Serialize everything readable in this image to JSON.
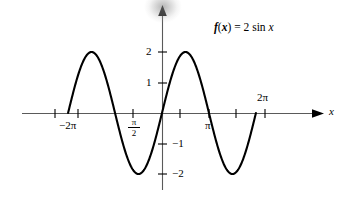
{
  "figure": {
    "function_label": {
      "f": "f",
      "paren_open": "(",
      "variable": "x",
      "paren_close": ")",
      "equals": " = ",
      "amplitude": "2",
      "trig": " sin ",
      "argument": "x"
    },
    "axis_label_x": "x",
    "curve_color": "#000000",
    "axis_color": "#555555"
  },
  "axes": {
    "x_ticks": [
      {
        "label": "−2π",
        "value": -6.2832,
        "px": 55
      },
      {
        "label": "",
        "value": -4.7124,
        "px": 78
      },
      {
        "label": "π/2",
        "value": -1.5708,
        "px": 133
      },
      {
        "label": "",
        "value": 1.5708,
        "px": 180
      },
      {
        "label": "π",
        "value": 3.1416,
        "px": 209
      },
      {
        "label": "",
        "value": 4.7124,
        "px": 236
      },
      {
        "label": "2π",
        "value": 6.2832,
        "px": 265
      }
    ],
    "x_tick_label_neg2pi": "−2π",
    "x_tick_label_pi": "π",
    "x_tick_label_2pi": "2π",
    "x_tick_fraction_numerator": "π",
    "x_tick_fraction_denominator": "2",
    "y_ticks": [
      {
        "label": "2",
        "value": 2,
        "px": 52
      },
      {
        "label": "1",
        "value": 1,
        "px": 83
      },
      {
        "label": "−1",
        "value": -1,
        "px": 144
      },
      {
        "label": "−2",
        "value": -2,
        "px": 174
      }
    ],
    "y_tick_label_2": "2",
    "y_tick_label_1": "1",
    "y_tick_label_neg1": "−1",
    "y_tick_label_neg2": "−2",
    "origin_px": {
      "x": 162,
      "y": 113
    },
    "x_unit_px": 14.95,
    "y_unit_px": 30.5,
    "x_axis_arrow": true,
    "y_axis_arrow": true,
    "grid": false
  },
  "chart_data": {
    "type": "line",
    "title": "",
    "subtitle": "",
    "xlabel": "x",
    "ylabel": "",
    "annotations": [
      {
        "text": "f(x) = 2 sin x",
        "x": 3.5,
        "y": 2.9
      }
    ],
    "legend": [],
    "legend_position": "none",
    "grid": false,
    "xlim": [
      -7.2,
      7.4
    ],
    "ylim": [
      -2.6,
      2.8
    ],
    "equation": "f(x) = 2 sin(x)",
    "amplitude": 2,
    "period": 6.2832,
    "series": [
      {
        "name": "f(x) = 2 sin x",
        "color": "#000000",
        "x": [
          -7.15,
          -6.9,
          -6.6,
          -6.283,
          -6.0,
          -5.7,
          -5.4,
          -5.1,
          -4.712,
          -4.4,
          -4.1,
          -3.8,
          -3.5,
          -3.142,
          -2.8,
          -2.5,
          -2.2,
          -1.9,
          -1.571,
          -1.25,
          -0.95,
          -0.65,
          -0.35,
          0.0,
          0.3,
          0.6,
          0.9,
          1.2,
          1.571,
          1.9,
          2.2,
          2.5,
          2.8,
          3.142,
          3.45,
          3.75,
          4.05,
          4.35,
          4.712,
          5.05,
          5.35,
          5.65,
          5.95,
          6.283,
          6.55
        ],
        "y": [
          -1.69,
          -1.15,
          -0.63,
          0.0,
          0.56,
          1.05,
          1.51,
          1.85,
          2.0,
          1.91,
          1.64,
          1.24,
          0.7,
          0.0,
          -0.67,
          -1.2,
          -1.62,
          -1.89,
          -2.0,
          -1.9,
          -1.63,
          -1.21,
          -0.69,
          0.0,
          0.59,
          1.13,
          1.57,
          1.86,
          2.0,
          1.89,
          1.62,
          1.2,
          0.67,
          0.0,
          -0.61,
          -1.13,
          -1.58,
          -1.87,
          -2.0,
          -1.88,
          -1.61,
          -1.14,
          -0.67,
          0.0,
          0.53
        ],
        "zero_crossings": [
          -6.283,
          -3.142,
          0.0,
          3.142,
          6.283
        ],
        "maxima": [
          {
            "x": -4.712,
            "y": 2
          },
          {
            "x": 1.571,
            "y": 2
          }
        ],
        "minima": [
          {
            "x": -1.571,
            "y": -2
          },
          {
            "x": 4.712,
            "y": -2
          }
        ]
      }
    ]
  }
}
